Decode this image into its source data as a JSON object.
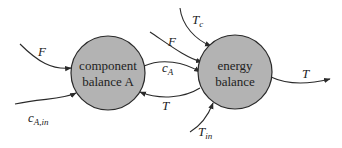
{
  "diagram": {
    "type": "block-flow",
    "colors": {
      "node_fill": "#b3b3b3",
      "stroke": "#2a2a2a",
      "text": "#222222",
      "background": "#ffffff"
    },
    "nodes": [
      {
        "id": "component",
        "line1": "component",
        "line2": "balance A"
      },
      {
        "id": "energy",
        "line1": "energy",
        "line2": "balance"
      }
    ],
    "edges": [
      {
        "from": "input",
        "to": "component",
        "var": "F",
        "sub": ""
      },
      {
        "from": "input",
        "to": "component",
        "var": "c",
        "sub": "A,in"
      },
      {
        "from": "component",
        "to": "energy",
        "var": "c",
        "sub": "A"
      },
      {
        "from": "energy",
        "to": "component",
        "var": "T",
        "sub": ""
      },
      {
        "from": "input",
        "to": "energy",
        "var": "T",
        "sub": "c"
      },
      {
        "from": "input",
        "to": "energy",
        "var": "F",
        "sub": ""
      },
      {
        "from": "input",
        "to": "energy",
        "var": "T",
        "sub": "in"
      },
      {
        "from": "energy",
        "to": "output",
        "var": "T",
        "sub": ""
      }
    ]
  }
}
